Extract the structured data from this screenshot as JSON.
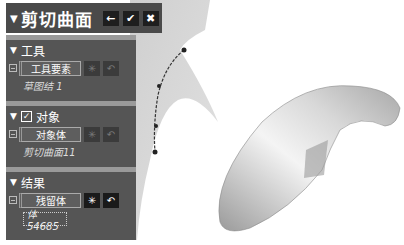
{
  "dialog": {
    "title": "剪切曲面",
    "buttons": {
      "back_icon": "←",
      "ok_icon": "✔",
      "cancel_icon": "✖"
    }
  },
  "sections": {
    "tool": {
      "header": "工具",
      "field_label": "工具要素",
      "selection": "草图结 1"
    },
    "target": {
      "header": "对象",
      "checked": true,
      "field_label": "对象体",
      "selection": "剪切曲面11"
    },
    "result": {
      "header": "结果",
      "field_label": "残留体",
      "selection": "体 54685"
    }
  },
  "icons": {
    "collapse": "▼",
    "check": "✓",
    "snowflake": "✳",
    "undo": "↶"
  },
  "colors": {
    "panel_bg": "#555555",
    "titlebar_bg": "#4a4a4a",
    "separator": "#9a9a9a",
    "button_bg": "#1e1e1e",
    "viewport_bg": "#ffffff",
    "surface_gray": "#d4d4d4"
  }
}
